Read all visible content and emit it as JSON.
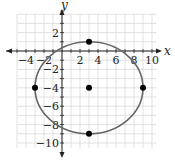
{
  "chart_data": {
    "type": "scatter",
    "title": "",
    "xlabel": "x",
    "ylabel": "y",
    "xlim": [
      -5,
      10.5
    ],
    "ylim": [
      -10.5,
      4
    ],
    "grid": true,
    "grid_step": 1,
    "x_ticks": [
      -4,
      -2,
      2,
      4,
      6,
      8,
      10
    ],
    "y_ticks": [
      2,
      -2,
      -4,
      -6,
      -8,
      -10
    ],
    "x_tick_labels": [
      "-4",
      "-2",
      "2",
      "4",
      "6",
      "8",
      "10"
    ],
    "y_tick_labels": [
      "2",
      "-2",
      "-4",
      "-6",
      "-8",
      "-10"
    ],
    "ellipse": {
      "center": [
        3,
        -4
      ],
      "semi_axis_x": 6,
      "semi_axis_y": 5,
      "equation": "(x-3)^2/36 + (y+4)^2/25 = 1",
      "color": "#666666"
    },
    "points": [
      {
        "label": "center",
        "x": 3,
        "y": -4
      },
      {
        "label": "top-vertex",
        "x": 3,
        "y": 1
      },
      {
        "label": "bottom-vertex",
        "x": 3,
        "y": -9
      },
      {
        "label": "left-vertex",
        "x": -3,
        "y": -4
      },
      {
        "label": "right-vertex",
        "x": 9,
        "y": -4
      }
    ],
    "colors": {
      "grid": "#d9d9d9",
      "axis": "#222222",
      "ellipse": "#666666",
      "points": "#000000"
    }
  }
}
